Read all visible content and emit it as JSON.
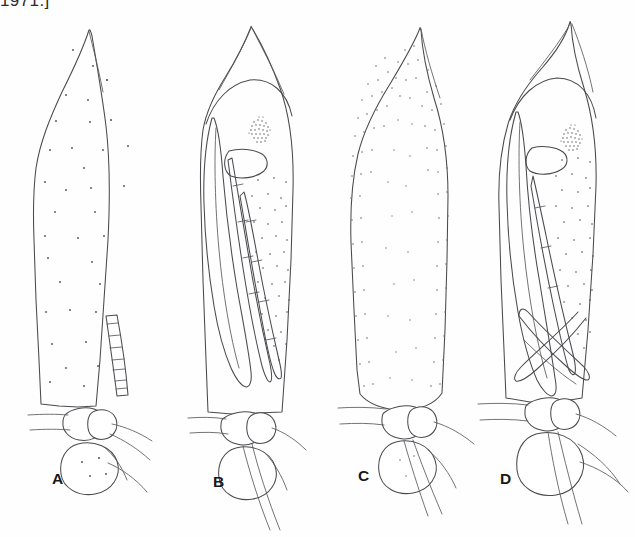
{
  "page": {
    "running_head": "1971.]",
    "background_color": "#ffffff",
    "ink_color": "#4a4a4e",
    "stipple_color": "#4d4d50",
    "width": 635,
    "height": 537
  },
  "figure": {
    "type": "scientific-line-drawing-plate",
    "panel_count": 4,
    "panels": [
      {
        "id": "A",
        "label": "A",
        "label_x": 52,
        "label_y": 484,
        "description": "elongate pointed specimen, sparse scattered stippling, segmented appendage at lower right, basal bulb with setae",
        "stipple_density": "sparse",
        "has_eye": false,
        "has_segmented_appendage": true,
        "has_basal_bulb": true,
        "apex_shape": "pointed"
      },
      {
        "id": "B",
        "label": "B",
        "label_x": 213,
        "label_y": 487,
        "description": "specimen with sharp triangular apex over rounded head, compound eye, wing sheath and segmented leg sheaths on left, stippled abdomen on right, basal bulb",
        "stipple_density": "medium",
        "has_eye": true,
        "has_segmented_appendage": true,
        "has_basal_bulb": true,
        "apex_shape": "triangular"
      },
      {
        "id": "C",
        "label": "C",
        "label_x": 358,
        "label_y": 481,
        "description": "broad elongate specimen, dense stippling concentrated along margins, rounded base, basal bulb with setae",
        "stipple_density": "dense",
        "has_eye": false,
        "has_segmented_appendage": false,
        "has_basal_bulb": true,
        "apex_shape": "pointed"
      },
      {
        "id": "D",
        "label": "D",
        "label_x": 500,
        "label_y": 484,
        "description": "specimen with hooked curved apex, compound eye, wing sheath and crossed leg sheaths, stippled abdomen, prominent basal bulb",
        "stipple_density": "medium",
        "has_eye": true,
        "has_segmented_appendage": true,
        "has_basal_bulb": true,
        "apex_shape": "hooked"
      }
    ]
  }
}
